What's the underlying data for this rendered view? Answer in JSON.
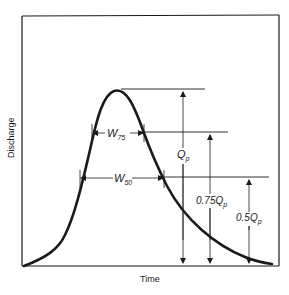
{
  "diagram": {
    "type": "hydrograph",
    "axes": {
      "x_label": "Time",
      "y_label": "Discharge"
    },
    "labels": {
      "w75": {
        "main": "W",
        "sub": "75"
      },
      "w50": {
        "main": "W",
        "sub": "50"
      },
      "qp": {
        "main": "Q",
        "sub": "p"
      },
      "q075": {
        "prefix": "0.75Q",
        "sub": "p"
      },
      "q05": {
        "prefix": "0.5Q",
        "sub": "p"
      }
    },
    "colors": {
      "ink": "#1a1a1a",
      "background": "#ffffff"
    }
  }
}
